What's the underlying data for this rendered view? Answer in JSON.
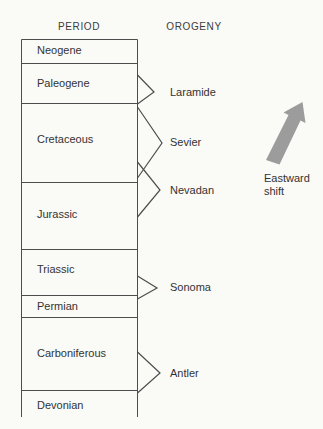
{
  "headers": {
    "period": "PERIOD",
    "orogeny": "OROGENY"
  },
  "periods": [
    {
      "name": "Neogene"
    },
    {
      "name": "Paleogene"
    },
    {
      "name": "Cretaceous"
    },
    {
      "name": "Jurassic"
    },
    {
      "name": "Triassic"
    },
    {
      "name": "Permian"
    },
    {
      "name": "Carboniferous"
    },
    {
      "name": "Devonian"
    }
  ],
  "orogenies": [
    {
      "name": "Laramide"
    },
    {
      "name": "Sevier"
    },
    {
      "name": "Nevadan"
    },
    {
      "name": "Sonoma"
    },
    {
      "name": "Antler"
    }
  ],
  "annotation": {
    "arrow_label": "Eastward shift",
    "arrow_direction": "up-right",
    "arrow_color": "#9c9c9c"
  },
  "colors": {
    "background": "#fafaf7",
    "line": "#4d4d4d",
    "text": "#333333"
  }
}
